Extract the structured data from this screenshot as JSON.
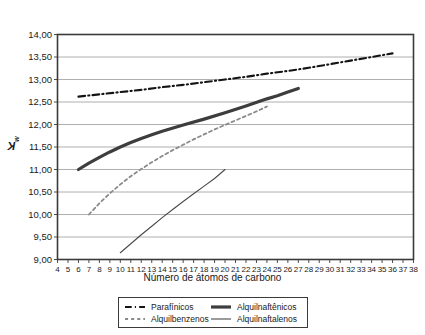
{
  "chart_data": {
    "type": "line",
    "title": "",
    "xlabel": "Número de átomos de carbono",
    "ylabel": "Kw",
    "ylabel_base": "K",
    "ylabel_sub": "w",
    "xlim": [
      4,
      38
    ],
    "ylim": [
      9.0,
      14.0
    ],
    "grid": true,
    "grid_axis": "y",
    "legend_position": "bottom-outside",
    "x_ticks": [
      4,
      5,
      6,
      7,
      8,
      9,
      10,
      11,
      12,
      13,
      14,
      15,
      16,
      17,
      18,
      19,
      20,
      21,
      22,
      23,
      24,
      25,
      26,
      27,
      28,
      29,
      30,
      31,
      32,
      33,
      34,
      35,
      36,
      37,
      38
    ],
    "x_tick_labels": [
      "4",
      "5",
      "6",
      "7",
      "8",
      "9",
      "10",
      "11",
      "12",
      "13",
      "14",
      "15",
      "16",
      "17",
      "18",
      "19",
      "20",
      "21",
      "22",
      "23",
      "24",
      "25",
      "26",
      "27",
      "28",
      "29",
      "30",
      "31",
      "32",
      "33",
      "34",
      "35",
      "36",
      "37",
      "38"
    ],
    "y_ticks": [
      9.0,
      9.5,
      10.0,
      10.5,
      11.0,
      11.5,
      12.0,
      12.5,
      13.0,
      13.5,
      14.0
    ],
    "y_tick_labels": [
      "9,00",
      "9,50",
      "10,00",
      "10,50",
      "11,00",
      "11,50",
      "12,00",
      "12,50",
      "13,00",
      "13,50",
      "14,00"
    ],
    "series": [
      {
        "name": "Parafínicos",
        "style": "dash-dot",
        "color": "#141414",
        "width": 2.1,
        "x": [
          6,
          8,
          10,
          12,
          14,
          16,
          18,
          20,
          22,
          24,
          26,
          28,
          30,
          32,
          34,
          36
        ],
        "y": [
          12.62,
          12.67,
          12.72,
          12.77,
          12.83,
          12.88,
          12.94,
          13.0,
          13.06,
          13.13,
          13.19,
          13.26,
          13.34,
          13.42,
          13.5,
          13.58
        ]
      },
      {
        "name": "Alquilnaftênicos",
        "style": "solid-thick",
        "color": "#3d3d3d",
        "width": 3.2,
        "x": [
          6,
          7,
          8,
          9,
          10,
          11,
          12,
          13,
          14,
          16,
          18,
          20,
          22,
          24,
          25,
          26,
          27
        ],
        "y": [
          11.0,
          11.14,
          11.27,
          11.39,
          11.5,
          11.6,
          11.69,
          11.77,
          11.85,
          11.99,
          12.12,
          12.26,
          12.41,
          12.57,
          12.64,
          12.72,
          12.8
        ]
      },
      {
        "name": "Alquilbenzenos",
        "style": "dashed",
        "color": "#8a8a8a",
        "width": 1.8,
        "x": [
          7,
          8,
          9,
          10,
          11,
          12,
          13,
          14,
          15,
          16,
          17,
          18,
          19,
          20,
          21,
          22,
          23,
          24
        ],
        "y": [
          10.0,
          10.25,
          10.47,
          10.67,
          10.85,
          11.01,
          11.16,
          11.3,
          11.43,
          11.55,
          11.67,
          11.78,
          11.89,
          11.99,
          12.09,
          12.19,
          12.29,
          12.4
        ]
      },
      {
        "name": "Alquilnaftalenos",
        "style": "solid-thin",
        "color": "#4a4a4a",
        "width": 1.1,
        "x": [
          10,
          11,
          12,
          13,
          14,
          15,
          16,
          17,
          18,
          19,
          20
        ],
        "y": [
          9.15,
          9.35,
          9.55,
          9.74,
          9.93,
          10.11,
          10.29,
          10.46,
          10.63,
          10.8,
          11.0
        ]
      }
    ]
  },
  "legend": {
    "entries": [
      {
        "label": "Parafínicos",
        "style": "dash-dot"
      },
      {
        "label": "Alquilnaftênicos",
        "style": "solid-thick"
      },
      {
        "label": "Alquilbenzenos",
        "style": "dashed"
      },
      {
        "label": "Alquilnaftalenos",
        "style": "solid-thin"
      }
    ]
  },
  "colors": {
    "axis": "#3a3a3a",
    "grid": "#9a9a9a",
    "background": "#ffffff",
    "text": "#1a1a1a"
  }
}
